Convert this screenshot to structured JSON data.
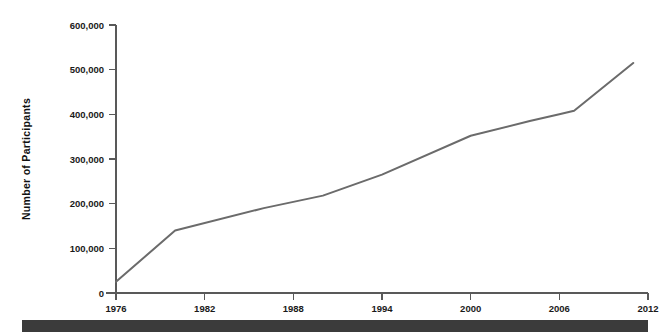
{
  "chart_data": {
    "type": "line",
    "title": "",
    "subtitle": "",
    "xlabel": "",
    "ylabel": "Number of Participants",
    "xlim": [
      1976,
      2012
    ],
    "ylim": [
      0,
      600000
    ],
    "grid": false,
    "legend": false,
    "legend_position": "none",
    "x_ticks": [
      1976,
      1982,
      1988,
      1994,
      2000,
      2006,
      2012
    ],
    "x_tick_labels": [
      "1976",
      "1982",
      "1988",
      "1994",
      "2000",
      "2006",
      "2012"
    ],
    "y_ticks": [
      0,
      100000,
      200000,
      300000,
      400000,
      500000,
      600000
    ],
    "y_tick_labels": [
      "0",
      "100,000",
      "200,000",
      "300,000",
      "400,000",
      "500,000",
      "600,000"
    ],
    "series": [
      {
        "name": "Participants",
        "color": "#6b6b6b",
        "x": [
          1976,
          1980,
          1986,
          1990,
          1994,
          2000,
          2004,
          2006,
          2007,
          2011
        ],
        "values": [
          25000,
          140000,
          190000,
          218000,
          265000,
          352000,
          385000,
          400000,
          408000,
          515000
        ]
      }
    ]
  },
  "colors": {
    "line": "#6b6b6b",
    "axis": "#595959",
    "text": "#1a1a1a",
    "footer_bar": "#3b3b3b",
    "background": "#ffffff"
  },
  "footer": {
    "bar_label": ""
  }
}
